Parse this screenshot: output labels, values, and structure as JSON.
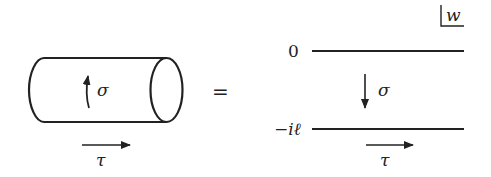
{
  "diagram": {
    "left": {
      "shape": "cylinder",
      "sigma_label": "σ",
      "sigma_direction": "up-curved",
      "tau_label": "τ",
      "tau_direction": "right"
    },
    "equals": "=",
    "right": {
      "shape": "strip",
      "corner_label": "w",
      "top_boundary_label": "0",
      "bottom_boundary_label": "−iℓ",
      "sigma_label": "σ",
      "sigma_direction": "down",
      "tau_label": "τ",
      "tau_direction": "right"
    }
  },
  "colors": {
    "ink": "#222222",
    "background": "#ffffff"
  }
}
